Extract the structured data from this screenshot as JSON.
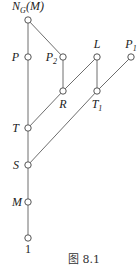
{
  "diagram": {
    "type": "subgroup-lattice",
    "nodes": [
      {
        "id": "NGM",
        "label": "N",
        "sub": "G",
        "suffix": "(M)"
      },
      {
        "id": "P",
        "label": "P"
      },
      {
        "id": "P2",
        "label": "P",
        "sub": "2"
      },
      {
        "id": "L",
        "label": "L"
      },
      {
        "id": "P1",
        "label": "P",
        "sub": "1"
      },
      {
        "id": "R",
        "label": "R"
      },
      {
        "id": "T1",
        "label": "T",
        "sub": "1"
      },
      {
        "id": "T",
        "label": "T"
      },
      {
        "id": "S",
        "label": "S"
      },
      {
        "id": "M",
        "label": "M"
      },
      {
        "id": "one",
        "label": "1"
      }
    ],
    "edges": [
      [
        "NGM",
        "P"
      ],
      [
        "P",
        "T"
      ],
      [
        "T",
        "S"
      ],
      [
        "S",
        "M"
      ],
      [
        "M",
        "one"
      ],
      [
        "NGM",
        "P2"
      ],
      [
        "P2",
        "R"
      ],
      [
        "R",
        "T"
      ],
      [
        "L",
        "R"
      ],
      [
        "L",
        "T1"
      ],
      [
        "P1",
        "T1"
      ],
      [
        "T1",
        "S"
      ]
    ]
  },
  "caption": "图 8.1"
}
